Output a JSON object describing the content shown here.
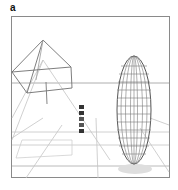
{
  "figure": {
    "panel_label": "a",
    "scene": {
      "frame": {
        "x": 11,
        "y": 16,
        "width": 159,
        "height": 162,
        "stroke": "#8a8a8a"
      },
      "horizon_y": 83,
      "objects": [
        {
          "name": "pyramid-wireframe",
          "stroke": "#6a6a6a"
        },
        {
          "name": "ellipsoid-wireframe",
          "stroke": "#555555",
          "shadow": "#d8d8d8"
        },
        {
          "name": "icon-column",
          "count": 5
        }
      ],
      "grid_stroke": "#bdbdbd"
    }
  }
}
